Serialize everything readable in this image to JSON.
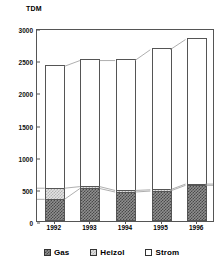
{
  "chart_data": {
    "type": "bar",
    "stacked": true,
    "title": "",
    "subtitle": "",
    "xlabel": "",
    "ylabel": "TDM",
    "unit_label": "TDM",
    "categories": [
      "1992",
      "1993",
      "1994",
      "1995",
      "1996"
    ],
    "series": [
      {
        "name": "Gas",
        "values": [
          340,
          510,
          455,
          470,
          560
        ],
        "pattern": "dark-checker",
        "color": "#4a4a4a"
      },
      {
        "name": "Heizol",
        "values": [
          175,
          30,
          25,
          20,
          20
        ],
        "pattern": "light-checker",
        "color": "#b2b2b2"
      },
      {
        "name": "Strom",
        "values": [
          1915,
          1980,
          2040,
          2200,
          2270
        ],
        "pattern": "solid-white",
        "color": "#ffffff"
      }
    ],
    "totals": [
      2430,
      2520,
      2520,
      2690,
      2850
    ],
    "ylim": [
      0,
      3000
    ],
    "yticks": [
      0,
      500,
      1000,
      1500,
      2000,
      2500,
      3000
    ],
    "ytick_labels": [
      "0",
      "500",
      "1000",
      "1500",
      "2000",
      "2500",
      "3000"
    ],
    "grid": false,
    "legend_position": "bottom",
    "connector_lines": true
  },
  "legend": {
    "items": [
      {
        "label": "Gas"
      },
      {
        "label": "Heizol"
      },
      {
        "label": "Strom"
      }
    ]
  }
}
